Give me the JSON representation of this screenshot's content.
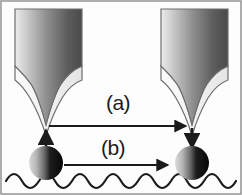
{
  "figure": {
    "kind": "schematic-diagram",
    "title": "",
    "background_color": "#fdfdfd",
    "border_color": "#9a9a9a",
    "ink_color": "#1b1b1b",
    "labels": [
      {
        "id": "a",
        "text": "(a)",
        "x": 118,
        "y": 110
      },
      {
        "id": "b",
        "text": "(b)",
        "x": 113,
        "y": 155
      }
    ],
    "probes": [
      {
        "id": "left-probe",
        "name": "scanning-probe-tip-left",
        "apex_x": 46,
        "apex_y": 125,
        "body_left": 15,
        "body_right": 82,
        "body_top": 9,
        "gradient_from": "#e9e9e9",
        "gradient_to": "#4f4f4f",
        "skirt_color": "#f2f2f2",
        "outline_color": "#6e6e6e"
      },
      {
        "id": "right-probe",
        "name": "scanning-probe-tip-right",
        "apex_x": 192,
        "apex_y": 125,
        "body_left": 161,
        "body_right": 228,
        "body_top": 9,
        "gradient_from": "#e9e9e9",
        "gradient_to": "#4f4f4f",
        "skirt_color": "#f2f2f2",
        "outline_color": "#6e6e6e"
      }
    ],
    "particles": [
      {
        "id": "left-particle",
        "name": "adsorbed-particle-left",
        "cx": 46,
        "cy": 163,
        "r": 17,
        "gradient_from": "#d4d4d4",
        "gradient_to": "#0c0c0c"
      },
      {
        "id": "right-particle",
        "name": "adsorbed-particle-right",
        "cx": 192,
        "cy": 163,
        "r": 17,
        "gradient_from": "#d4d4d4",
        "gradient_to": "#0c0c0c"
      }
    ],
    "arrows": [
      {
        "id": "pickup",
        "name": "arrow-particle-pickup-up",
        "direction": "up",
        "from_x": 46,
        "from_y": 161,
        "to_x": 46,
        "to_y": 127
      },
      {
        "id": "transfer-a",
        "name": "arrow-tip-transfer-horizontal",
        "direction": "right",
        "from_x": 49,
        "from_y": 126,
        "to_x": 190,
        "to_y": 126
      },
      {
        "id": "dropoff",
        "name": "arrow-particle-dropoff-down",
        "direction": "down",
        "from_x": 192,
        "from_y": 128,
        "to_x": 192,
        "to_y": 150
      },
      {
        "id": "transfer-b",
        "name": "arrow-surface-transfer-horizontal",
        "direction": "right",
        "from_x": 64,
        "from_y": 165,
        "to_x": 172,
        "to_y": 165
      }
    ],
    "surface": {
      "name": "corrugated-substrate-surface",
      "description": "sinusoidal corrugated surface",
      "baseline_y": 181,
      "amplitude": 7,
      "periods": 7,
      "x_start": 6,
      "x_end": 236,
      "stroke_color": "#1b1b1b",
      "stroke_width": 2.2
    }
  }
}
